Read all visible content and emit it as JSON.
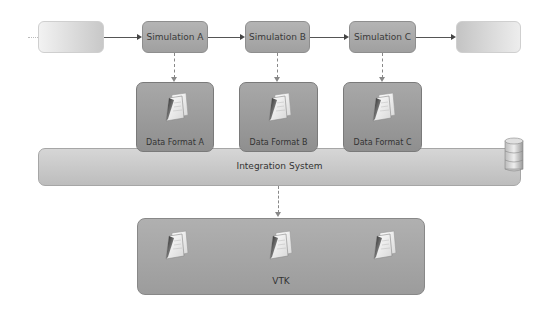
{
  "pipeline": {
    "stages": [
      {
        "id": "upstream",
        "label": "",
        "faded": true
      },
      {
        "id": "sim-a",
        "label": "Simulation A"
      },
      {
        "id": "sim-b",
        "label": "Simulation B"
      },
      {
        "id": "sim-c",
        "label": "Simulation C"
      },
      {
        "id": "downstream",
        "label": "",
        "faded": true
      }
    ]
  },
  "data_formats": [
    {
      "label": "Data Format A",
      "icon": "document-icon"
    },
    {
      "label": "Data Format B",
      "icon": "document-icon"
    },
    {
      "label": "Data Format C",
      "icon": "document-icon"
    }
  ],
  "integration": {
    "label": "Integration System",
    "icon": "database-icon"
  },
  "vtk": {
    "label": "VTK",
    "icons": [
      "document-icon",
      "document-icon",
      "document-icon"
    ]
  },
  "colors": {
    "box": "#a8a8a8",
    "arrow": "#444444",
    "dashed": "#888888",
    "background": "#ffffff"
  }
}
